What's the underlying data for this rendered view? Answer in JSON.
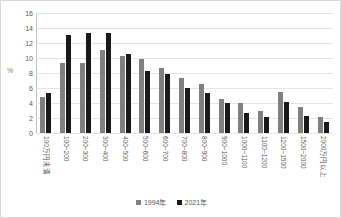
{
  "chart_data": {
    "type": "bar",
    "title": "",
    "xlabel": "",
    "ylabel": "%",
    "ylim": [
      0,
      16
    ],
    "yticks": [
      16,
      14,
      12,
      10,
      8,
      6,
      4,
      2,
      0
    ],
    "grid": true,
    "legend_position": "bottom",
    "categories": [
      "100万円未満",
      "100~200",
      "200~300",
      "300~400",
      "400~500",
      "500~600",
      "600~700",
      "700~800",
      "800~900",
      "900~1000",
      "1000~1100",
      "1100~1200",
      "1200~1500",
      "1500~2000",
      "2000万円以上"
    ],
    "series": [
      {
        "name": "1994年",
        "color": "#808080",
        "values": [
          4.8,
          9.3,
          9.4,
          11.1,
          10.3,
          9.9,
          8.7,
          7.3,
          6.5,
          4.5,
          4.0,
          3.0,
          5.5,
          3.5,
          2.1
        ]
      },
      {
        "name": "2021年",
        "color": "#1a1a1a",
        "values": [
          5.4,
          13.1,
          13.3,
          13.4,
          10.5,
          8.3,
          7.9,
          6.0,
          5.3,
          4.0,
          2.7,
          2.2,
          4.1,
          2.3,
          1.5
        ]
      }
    ]
  }
}
